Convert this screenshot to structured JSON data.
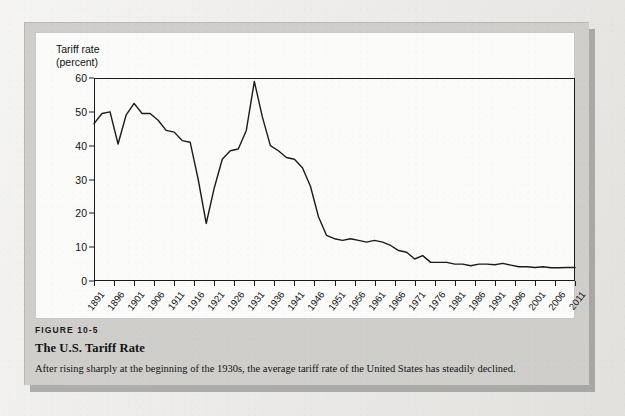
{
  "figure": {
    "number": "FIGURE 10-5",
    "title": "The U.S. Tariff Rate",
    "description": "After rising sharply at the beginning of the 1930s, the average tariff rate of the United States has steadily declined."
  },
  "chart_data": {
    "type": "line",
    "title": "The U.S. Tariff Rate",
    "axis_title": "Tariff rate\n(percent)",
    "xlabel": "",
    "ylabel": "Tariff rate (percent)",
    "ylim": [
      0,
      60
    ],
    "xlim": [
      1891,
      2011
    ],
    "yticks": [
      0,
      10,
      20,
      30,
      40,
      50,
      60
    ],
    "grid": false,
    "legend": false,
    "tick_labels": [
      "1891",
      "1896",
      "1901",
      "1906",
      "1911",
      "1916",
      "1921",
      "1926",
      "1931",
      "1936",
      "1941",
      "1946",
      "1951",
      "1956",
      "1961",
      "1966",
      "1971",
      "1976",
      "1981",
      "1986",
      "1991",
      "1996",
      "2001",
      "2006",
      "2011"
    ],
    "series": [
      {
        "name": "Average U.S. tariff rate",
        "color": "#1b1b1b",
        "x": [
          1891,
          1893,
          1895,
          1897,
          1899,
          1901,
          1903,
          1905,
          1907,
          1909,
          1911,
          1913,
          1915,
          1917,
          1919,
          1921,
          1923,
          1925,
          1927,
          1929,
          1931,
          1933,
          1935,
          1937,
          1939,
          1941,
          1943,
          1945,
          1947,
          1949,
          1951,
          1953,
          1955,
          1957,
          1959,
          1961,
          1963,
          1965,
          1967,
          1969,
          1971,
          1973,
          1975,
          1977,
          1979,
          1981,
          1983,
          1985,
          1987,
          1989,
          1991,
          1993,
          1995,
          1997,
          1999,
          2001,
          2003,
          2005,
          2007,
          2009,
          2011
        ],
        "y": [
          46.5,
          49.5,
          50.0,
          40.5,
          49.0,
          52.5,
          49.5,
          49.5,
          47.5,
          44.5,
          44.0,
          41.5,
          41.0,
          30.0,
          17.0,
          27.5,
          36.0,
          38.5,
          39.0,
          44.5,
          59.0,
          48.5,
          40.0,
          38.5,
          36.5,
          36.0,
          33.5,
          28.0,
          19.0,
          13.5,
          12.5,
          12.0,
          12.5,
          12.0,
          11.5,
          12.0,
          11.5,
          10.5,
          9.0,
          8.5,
          6.5,
          7.5,
          5.5,
          5.5,
          5.5,
          5.0,
          5.0,
          4.5,
          5.0,
          5.0,
          4.8,
          5.2,
          4.7,
          4.2,
          4.2,
          4.0,
          4.2,
          3.9,
          3.9,
          4.0,
          4.0
        ]
      }
    ]
  }
}
